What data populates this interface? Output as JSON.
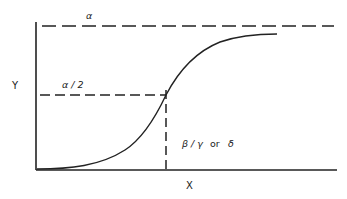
{
  "diagram": {
    "type": "sigmoid-curve",
    "axes": {
      "x_label": "X",
      "y_label": "Y"
    },
    "annotations": {
      "asymptote_label": "α",
      "half_max_label": "α / 2",
      "midpoint_label_part1": "β / γ",
      "midpoint_label_or": "or",
      "midpoint_label_part2": "δ"
    },
    "colors": {
      "line": "#222222",
      "background": "#ffffff"
    }
  }
}
